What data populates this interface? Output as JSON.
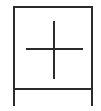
{
  "symbol": {
    "name": "boxed-plus-symbol",
    "stroke_color": "#2b2b2b",
    "background_color": "#ffffff",
    "stroke_width": 2,
    "frame": {
      "left": 14,
      "right": 92,
      "top": 7,
      "bottom": 89,
      "leg_bottom": 105
    },
    "cross": {
      "cx": 54,
      "cy": 49,
      "h_x1": 27,
      "h_x2": 82,
      "v_y1": 22,
      "v_y2": 78
    }
  }
}
